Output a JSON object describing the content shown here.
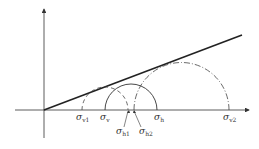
{
  "diagram": {
    "type": "mohr-circle-diagram",
    "axes": {
      "x_axis": "normal stress",
      "y_axis": "shear stress"
    },
    "failure_envelope": {
      "style": "solid-thick",
      "from": [
        44,
        110
      ],
      "to": [
        242,
        35
      ]
    },
    "circles": [
      {
        "name": "circle-v1-h1",
        "style": "dashed",
        "left": "σv1",
        "right": "σh1"
      },
      {
        "name": "circle-v-h",
        "style": "solid",
        "left": "σv",
        "right": "σh"
      },
      {
        "name": "circle-h2-v2",
        "style": "dash-dot",
        "left": "σh2",
        "right": "σv2"
      }
    ],
    "labels": [
      {
        "id": "sv1",
        "base": "σ",
        "sub": "v1"
      },
      {
        "id": "sv",
        "base": "σ",
        "sub": "v"
      },
      {
        "id": "sh1",
        "base": "σ",
        "sub": "h1"
      },
      {
        "id": "sh2",
        "base": "σ",
        "sub": "h2"
      },
      {
        "id": "sh",
        "base": "σ",
        "sub": "h"
      },
      {
        "id": "sv2",
        "base": "σ",
        "sub": "v2"
      }
    ]
  },
  "colors": {
    "stroke": "#333333",
    "background": "#ffffff"
  }
}
